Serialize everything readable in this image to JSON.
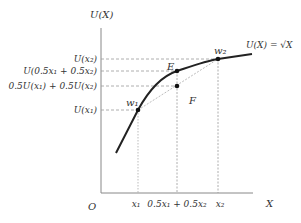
{
  "diagram": {
    "axes": {
      "y_label": "U(X)",
      "x_label": "X",
      "origin_label": "O"
    },
    "curve_label": "U(X) = √X",
    "y_ticks": [
      {
        "label": "U(x₂)"
      },
      {
        "label": "U(0.5x₁ + 0.5x₂)"
      },
      {
        "label": "0.5U(x₁) + 0.5U(x₂)"
      },
      {
        "label": "U(x₁)"
      }
    ],
    "x_ticks": [
      {
        "label": "x₁"
      },
      {
        "label": "0.5x₁ + 0.5x₂"
      },
      {
        "label": "x₂"
      }
    ],
    "points": [
      {
        "name": "w1",
        "label": "w₁"
      },
      {
        "name": "E",
        "label": "E"
      },
      {
        "name": "F",
        "label": "F"
      },
      {
        "name": "w2",
        "label": "w₂"
      }
    ],
    "colors": {
      "axis": "#888888",
      "curve": "#222222",
      "dashed": "#999999",
      "text": "#333333"
    }
  }
}
